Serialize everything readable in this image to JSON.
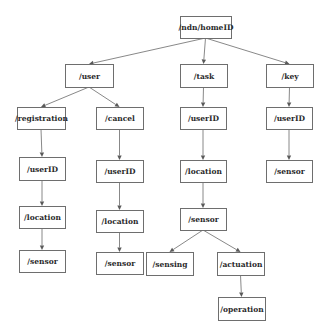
{
  "diagram": {
    "type": "tree",
    "colors": {
      "box_border": "#6e6e6e",
      "edge": "#7a7a7a",
      "text": "#2a2a2a",
      "background": "#ffffff"
    },
    "nodes": [
      {
        "id": "root",
        "label": "/ndn/homeID",
        "x": 180,
        "y": 16,
        "w": 51,
        "h": 22
      },
      {
        "id": "user",
        "label": "/user",
        "x": 65,
        "y": 64,
        "w": 48,
        "h": 23
      },
      {
        "id": "task",
        "label": "/task",
        "x": 180,
        "y": 64,
        "w": 47,
        "h": 23
      },
      {
        "id": "key",
        "label": "/key",
        "x": 266,
        "y": 64,
        "w": 47,
        "h": 23
      },
      {
        "id": "registration",
        "label": "/registration",
        "x": 17,
        "y": 107,
        "w": 48,
        "h": 22
      },
      {
        "id": "cancel",
        "label": "/cancel",
        "x": 96,
        "y": 107,
        "w": 47,
        "h": 22
      },
      {
        "id": "task_userID",
        "label": "/userID",
        "x": 180,
        "y": 107,
        "w": 46,
        "h": 22
      },
      {
        "id": "key_userID",
        "label": "/userID",
        "x": 266,
        "y": 107,
        "w": 46,
        "h": 22
      },
      {
        "id": "reg_userID",
        "label": "/userID",
        "x": 19,
        "y": 157,
        "w": 46,
        "h": 23
      },
      {
        "id": "cancel_userID",
        "label": "/userID",
        "x": 96,
        "y": 160,
        "w": 47,
        "h": 22
      },
      {
        "id": "task_location",
        "label": "/location",
        "x": 180,
        "y": 160,
        "w": 46,
        "h": 22
      },
      {
        "id": "key_sensor",
        "label": "/sensor",
        "x": 266,
        "y": 160,
        "w": 46,
        "h": 22
      },
      {
        "id": "reg_location",
        "label": "/location",
        "x": 19,
        "y": 206,
        "w": 46,
        "h": 22
      },
      {
        "id": "cancel_location",
        "label": "/location",
        "x": 96,
        "y": 210,
        "w": 47,
        "h": 22
      },
      {
        "id": "task_sensor",
        "label": "/sensor",
        "x": 180,
        "y": 208,
        "w": 46,
        "h": 22
      },
      {
        "id": "reg_sensor",
        "label": "/sensor",
        "x": 19,
        "y": 250,
        "w": 46,
        "h": 22
      },
      {
        "id": "cancel_sensor",
        "label": "/sensor",
        "x": 96,
        "y": 252,
        "w": 47,
        "h": 22
      },
      {
        "id": "sensing",
        "label": "/sensing",
        "x": 146,
        "y": 252,
        "w": 47,
        "h": 23
      },
      {
        "id": "actuation",
        "label": "/actuation",
        "x": 217,
        "y": 252,
        "w": 47,
        "h": 23
      },
      {
        "id": "operation",
        "label": "/operation",
        "x": 218,
        "y": 297,
        "w": 47,
        "h": 23
      }
    ],
    "edges": [
      {
        "from": "root",
        "to": "user"
      },
      {
        "from": "root",
        "to": "task"
      },
      {
        "from": "root",
        "to": "key"
      },
      {
        "from": "user",
        "to": "registration"
      },
      {
        "from": "user",
        "to": "cancel"
      },
      {
        "from": "task",
        "to": "task_userID"
      },
      {
        "from": "key",
        "to": "key_userID"
      },
      {
        "from": "registration",
        "to": "reg_userID"
      },
      {
        "from": "cancel",
        "to": "cancel_userID"
      },
      {
        "from": "task_userID",
        "to": "task_location"
      },
      {
        "from": "key_userID",
        "to": "key_sensor"
      },
      {
        "from": "reg_userID",
        "to": "reg_location"
      },
      {
        "from": "cancel_userID",
        "to": "cancel_location"
      },
      {
        "from": "task_location",
        "to": "task_sensor"
      },
      {
        "from": "reg_location",
        "to": "reg_sensor"
      },
      {
        "from": "cancel_location",
        "to": "cancel_sensor"
      },
      {
        "from": "task_sensor",
        "to": "sensing"
      },
      {
        "from": "task_sensor",
        "to": "actuation"
      },
      {
        "from": "actuation",
        "to": "operation"
      }
    ]
  }
}
